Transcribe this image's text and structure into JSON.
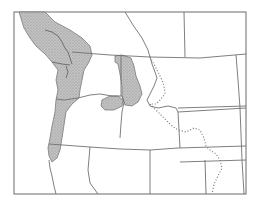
{
  "map": {
    "title": "",
    "region": "Pacific Northwest, North America",
    "shaded_color": "#b4b4b4",
    "line_color": "#707070",
    "frame": {
      "x": 14,
      "y": 12,
      "width": 232,
      "height": 182
    },
    "legend": [],
    "features": [
      {
        "name": "coastal-range",
        "type": "shaded-region"
      },
      {
        "name": "inland-range-idaho",
        "type": "shaded-region"
      },
      {
        "name": "inland-range-oregon",
        "type": "shaded-region"
      },
      {
        "name": "continental-divide",
        "type": "dotted-line"
      },
      {
        "name": "state-and-province-borders",
        "type": "lines"
      }
    ]
  }
}
